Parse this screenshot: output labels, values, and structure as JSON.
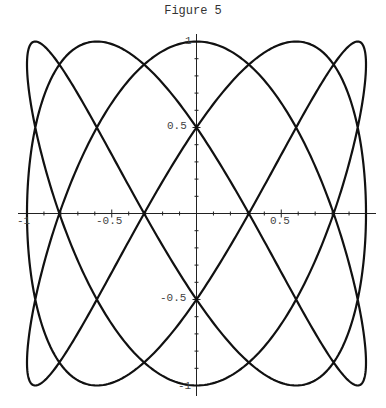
{
  "chart_data": {
    "type": "line",
    "title": "Figure 5",
    "xlabel": "",
    "ylabel": "",
    "xlim": [
      -1,
      1
    ],
    "ylim": [
      -1,
      1
    ],
    "grid": false,
    "legend": null,
    "parametric": {
      "x": "sin(3t)",
      "y": "cos(5t)",
      "t_range": [
        0,
        6.2832
      ]
    },
    "x_ticks": [
      -1,
      -0.5,
      0.5,
      1
    ],
    "x_tick_labels": [
      "-1",
      "-0.5",
      "0.5",
      ""
    ],
    "y_ticks": [
      1,
      0.5,
      -0.5,
      -1
    ],
    "y_tick_labels": [
      "1",
      "0.5",
      "-0.5",
      "-1"
    ],
    "axes_through_origin": true,
    "line_color": "#111111"
  },
  "labels": {
    "title": "Figure 5",
    "x_neg1": "-1",
    "x_neg05": "-0.5",
    "x_05": "0.5",
    "y_1": "1",
    "y_05": "0.5",
    "y_neg05": "-0.5",
    "y_neg1": "-1"
  }
}
